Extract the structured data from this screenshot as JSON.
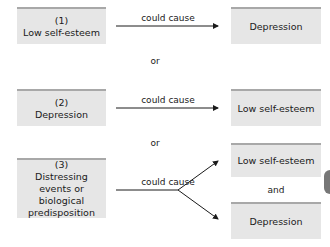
{
  "diagram": {
    "row1": {
      "cause": {
        "number": "(1)",
        "label": "Low self-esteem"
      },
      "relation": "could cause",
      "effect": {
        "label": "Depression"
      }
    },
    "separator1": "or",
    "row2": {
      "cause": {
        "number": "(2)",
        "label": "Depression"
      },
      "relation": "could cause",
      "effect": {
        "label": "Low self-esteem"
      }
    },
    "separator2": "or",
    "row3": {
      "cause": {
        "number": "(3)",
        "label": "Distressing events or biological predisposition"
      },
      "relation": "could cause",
      "effect_top": {
        "label": "Low self-esteem"
      },
      "conjunction": "and",
      "effect_bottom": {
        "label": "Depression"
      }
    }
  },
  "colors": {
    "box_fill": "#e6e6e6",
    "box_top_border": "#a8a8a8",
    "text": "#1a1a1a"
  }
}
